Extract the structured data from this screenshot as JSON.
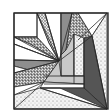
{
  "diagram": {
    "width": 110,
    "height": 111,
    "background": "#ffffff",
    "stroke": "#2a2a2a",
    "border": {
      "x": 14,
      "y": 13,
      "w": 94,
      "h": 96
    },
    "fills": {
      "white": "#ffffff",
      "light_gray": "#c8c8c8",
      "mid_gray": "#8e8e8e",
      "dark_gray": "#555555",
      "dots": "pattern:dots",
      "speckle": "pattern:speckle",
      "crosshatch": "pattern:crosshatch"
    },
    "pieces": [
      {
        "name": "top-left-white-square",
        "fill": "white",
        "points": "14,13 37,13 37,37 14,37"
      },
      {
        "name": "top-left-crosshatch-wedge",
        "fill": "crosshatch",
        "points": "37,13 59,61 49,43"
      },
      {
        "name": "top-crosshatch-tall-wedge",
        "fill": "crosshatch",
        "points": "37,13 49,43 59,61 45,13"
      },
      {
        "name": "top-white-band",
        "fill": "white",
        "points": "45,13 61,13 61,55 59,61"
      },
      {
        "name": "left-speckle-wedge",
        "fill": "speckle",
        "points": "14,37 37,37 59,61 30,44"
      },
      {
        "name": "left-white-strip",
        "fill": "white",
        "points": "14,37 30,44 59,61 14,44"
      },
      {
        "name": "left-white-band",
        "fill": "white",
        "points": "14,44 59,61 14,60"
      },
      {
        "name": "top-mid-gray-wedge",
        "fill": "mid_gray",
        "points": "61,13 72,13 66,50 61,55"
      },
      {
        "name": "top-speckle-wedge",
        "fill": "speckle",
        "points": "72,13 78,13 92,36 66,50"
      },
      {
        "name": "top-white-corner",
        "fill": "white",
        "points": "78,13 107,13 92,36"
      },
      {
        "name": "right-dotted-large",
        "fill": "dots",
        "points": "107,13 107,109 92,36"
      },
      {
        "name": "inner-light-strip-vertical",
        "fill": "light_gray",
        "points": "61,55 66,50 74,34 74,76 61,76"
      },
      {
        "name": "inner-dotted-vertical",
        "fill": "dots",
        "points": "74,34 84,38 84,76 74,76"
      },
      {
        "name": "right-dark-wedge",
        "fill": "dark_gray",
        "points": "84,38 92,36 107,109 84,88"
      },
      {
        "name": "left-mid-gray-band",
        "fill": "mid_gray",
        "points": "14,60 59,61 40,73 14,66"
      },
      {
        "name": "left-white-small",
        "fill": "white",
        "points": "14,66 40,73 14,73"
      },
      {
        "name": "left-speckle-lower-wedge",
        "fill": "speckle",
        "points": "14,73 59,61 44,82 14,87"
      },
      {
        "name": "left-white-lower",
        "fill": "white",
        "points": "14,87 44,82 14,95"
      },
      {
        "name": "inner-light-horizontal",
        "fill": "light_gray",
        "points": "59,61 61,76 84,76 84,84 44,82"
      },
      {
        "name": "inner-white-horizontal",
        "fill": "white",
        "points": "44,82 84,84 84,88 40,88"
      },
      {
        "name": "bottom-dark-band",
        "fill": "dark_gray",
        "points": "40,88 84,88 107,109 60,88"
      },
      {
        "name": "bottom-dotted-large",
        "fill": "dots",
        "points": "14,95 40,88 107,109 14,109"
      }
    ],
    "lines": [
      {
        "name": "center-ray-1",
        "x1": 37,
        "y1": 13,
        "x2": 59,
        "y2": 61
      },
      {
        "name": "center-ray-2",
        "x1": 45,
        "y1": 13,
        "x2": 59,
        "y2": 61
      },
      {
        "name": "center-ray-3",
        "x1": 14,
        "y1": 37,
        "x2": 59,
        "y2": 61
      },
      {
        "name": "center-ray-4",
        "x1": 14,
        "y1": 44,
        "x2": 59,
        "y2": 61
      },
      {
        "name": "center-ray-5",
        "x1": 14,
        "y1": 60,
        "x2": 59,
        "y2": 61
      },
      {
        "name": "center-ray-6",
        "x1": 14,
        "y1": 73,
        "x2": 59,
        "y2": 61
      },
      {
        "name": "center-ray-7",
        "x1": 72,
        "y1": 13,
        "x2": 59,
        "y2": 61
      },
      {
        "name": "center-ray-8",
        "x1": 92,
        "y1": 36,
        "x2": 59,
        "y2": 61
      },
      {
        "name": "vertical-61",
        "x1": 61,
        "y1": 13,
        "x2": 61,
        "y2": 76
      },
      {
        "name": "vertical-74",
        "x1": 74,
        "y1": 34,
        "x2": 74,
        "y2": 84
      },
      {
        "name": "vertical-84",
        "x1": 84,
        "y1": 38,
        "x2": 84,
        "y2": 88
      },
      {
        "name": "horizontal-76",
        "x1": 44,
        "y1": 76,
        "x2": 84,
        "y2": 76
      },
      {
        "name": "horizontal-84",
        "x1": 44,
        "y1": 84,
        "x2": 84,
        "y2": 84
      },
      {
        "name": "diag-right",
        "x1": 107,
        "y1": 13,
        "x2": 78,
        "y2": 40
      },
      {
        "name": "diag-right-long",
        "x1": 92,
        "y1": 36,
        "x2": 107,
        "y2": 109
      },
      {
        "name": "diag-bottom",
        "x1": 14,
        "y1": 109,
        "x2": 44,
        "y2": 82
      },
      {
        "name": "diag-bottom-long",
        "x1": 40,
        "y1": 88,
        "x2": 107,
        "y2": 109
      },
      {
        "name": "top-left-square-right",
        "x1": 37,
        "y1": 13,
        "x2": 37,
        "y2": 37
      },
      {
        "name": "top-left-square-bottom",
        "x1": 14,
        "y1": 37,
        "x2": 37,
        "y2": 37
      }
    ]
  }
}
